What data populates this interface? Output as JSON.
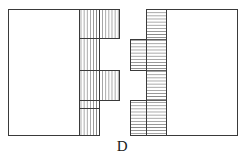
{
  "figure": {
    "label": "D",
    "caption_position": "below-center",
    "stroke_color": "#3a3a3a",
    "hatch_color": "#555555",
    "background_color": "#ffffff",
    "stroke_width": 1,
    "hatch_width": 0.6
  },
  "left_piece": {
    "name": "left-member",
    "body": {
      "x": 8,
      "y": 9,
      "width": 91,
      "height": 126
    },
    "hatch_direction": "vertical",
    "hatch_spacing": 3.1,
    "hatch_band": {
      "x": 79,
      "y": 9,
      "width": 20,
      "height": 126
    },
    "tenons": [
      {
        "id": "tenon-top",
        "x": 79,
        "y": 9,
        "width": 40,
        "height": 29
      },
      {
        "id": "tenon-middle",
        "x": 79,
        "y": 70,
        "width": 40,
        "height": 30
      }
    ],
    "step_lines_y": [
      38,
      70,
      100,
      108
    ]
  },
  "right_piece": {
    "name": "right-member",
    "body": {
      "x": 166,
      "y": 9,
      "width": 71,
      "height": 126
    },
    "hatch_direction": "horizontal",
    "hatch_spacing": 3.1,
    "spine": {
      "x": 146,
      "y": 9,
      "width": 20,
      "height": 126
    },
    "fingers": [
      {
        "id": "finger-upper",
        "x": 130,
        "y": 39,
        "width": 36,
        "height": 31
      },
      {
        "id": "finger-lower",
        "x": 130,
        "y": 100,
        "width": 36,
        "height": 35
      }
    ],
    "step_lines_x": [
      146
    ]
  }
}
